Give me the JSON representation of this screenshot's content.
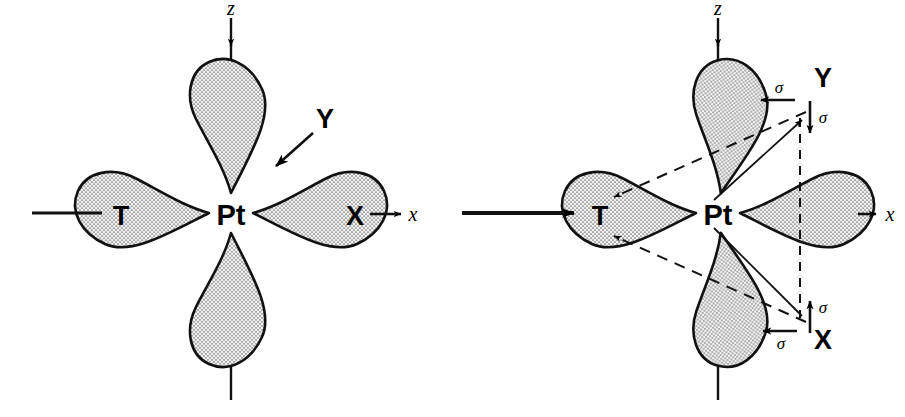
{
  "figure": {
    "panels": [
      {
        "id": "left",
        "name": "before-attack",
        "center_label": "Pt",
        "trans_ligand_label": "T",
        "leaving_group_label": "X",
        "incoming_group_label": "Y",
        "axis_x_label": "x",
        "axis_z_label": "z",
        "has_incoming_arrow": true,
        "has_bond_arrow_to_T": false
      },
      {
        "id": "right",
        "name": "trigonal-bipyramidal-intermediate",
        "center_label": "Pt",
        "trans_ligand_label": "T",
        "leaving_group_label": "X",
        "incoming_group_label": "Y",
        "axis_x_label": "x",
        "axis_z_label": "z",
        "has_incoming_arrow": false,
        "has_bond_arrow_to_T": true,
        "sigma_labels": [
          {
            "id": "y-horizontal",
            "text": "σ",
            "direction": "left"
          },
          {
            "id": "y-vertical",
            "text": "σ",
            "direction": "down"
          },
          {
            "id": "x-vertical",
            "text": "σ",
            "direction": "up"
          },
          {
            "id": "x-horizontal",
            "text": "σ",
            "direction": "left"
          }
        ]
      }
    ],
    "colors": {
      "ink": "#000000",
      "lobe_fill": "#e8e8e8",
      "lobe_stipple": "#6a6a6a",
      "background": "#ffffff"
    }
  }
}
